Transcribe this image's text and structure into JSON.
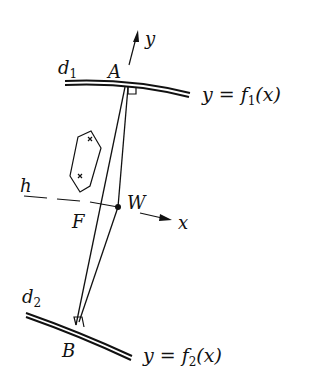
{
  "diagram": {
    "labels": {
      "y_axis": "y",
      "x_axis": "x",
      "A": "A",
      "B": "B",
      "W": "W",
      "F": "F",
      "h": "h",
      "d1_main": "d",
      "d1_sub": "1",
      "d2_main": "d",
      "d2_sub": "2",
      "curve1_lhs": "y",
      "curve1_eq": "=",
      "curve1_f": "f",
      "curve1_sub": "1",
      "curve1_arg": "(x)",
      "curve2_lhs": "y",
      "curve2_eq": "=",
      "curve2_f": "f",
      "curve2_sub": "2",
      "curve2_arg": "(x)"
    },
    "colors": {
      "ink": "#111111",
      "background": "#ffffff"
    }
  }
}
